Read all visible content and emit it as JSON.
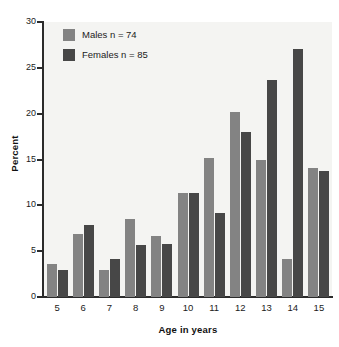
{
  "chart_data": {
    "type": "bar",
    "title": "",
    "subtitle": "",
    "xlabel": "Age in years",
    "ylabel": "Percent",
    "categories": [
      "5",
      "6",
      "7",
      "8",
      "9",
      "10",
      "11",
      "12",
      "13",
      "14",
      "15"
    ],
    "series": [
      {
        "name": "Males n = 74",
        "short_name": "Males",
        "color": "#838383",
        "values": [
          3.6,
          6.9,
          2.9,
          8.5,
          6.7,
          11.4,
          15.2,
          20.2,
          14.9,
          4.1,
          14.1
        ]
      },
      {
        "name": "Females n = 85",
        "short_name": "Females",
        "color": "#474747",
        "values": [
          2.9,
          7.9,
          4.2,
          5.7,
          5.8,
          11.4,
          9.2,
          18.0,
          23.7,
          27.1,
          13.7
        ]
      }
    ],
    "ylim": [
      0,
      30
    ],
    "yticks": [
      0,
      5,
      10,
      15,
      20,
      25,
      30
    ],
    "ytick_labels": [
      "0",
      "5",
      "10",
      "15",
      "20",
      "25",
      "30"
    ],
    "grid": false,
    "legend_position": "top-left",
    "plot_background": "#f4f4f2",
    "axis_color": "#2b2b2b"
  },
  "legend": {
    "entries": [
      {
        "label": "Males n = 74"
      },
      {
        "label": "Females n = 85"
      }
    ]
  },
  "axes": {
    "x_title": "Age in years",
    "y_title": "Percent"
  }
}
